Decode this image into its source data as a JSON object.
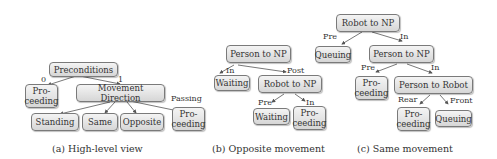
{
  "panels": [
    {
      "caption": "(a) High-level view",
      "nodes": {
        "preconditions": "Preconditions",
        "proceeding": "Pro-\nceeding",
        "movement_direction": "Movement Direction",
        "standing": "Standing",
        "same": "Same",
        "opposite": "Opposite",
        "proceeding2": "Pro-\nceeding"
      },
      "edge_labels": {
        "zero": "0",
        "one": "1",
        "passing": "Passing"
      }
    },
    {
      "caption": "(b) Opposite movement",
      "nodes": {
        "person_to_np": "Person to NP",
        "waiting": "Waiting",
        "robot_to_np": "Robot to NP",
        "waiting2": "Waiting",
        "proceeding": "Pro-\nceeding"
      },
      "edge_labels": {
        "in": "In",
        "post": "Post",
        "pre": "Pre",
        "in2": "In"
      }
    },
    {
      "caption": "(c) Same movement",
      "nodes": {
        "robot_to_np": "Robot to NP",
        "queuing": "Queuing",
        "person_to_np": "Person to NP",
        "proceeding": "Pro-\nceeding",
        "person_to_robot": "Person to Robot",
        "proceeding2": "Pro-\nceeding",
        "queuing2": "Queuing"
      },
      "edge_labels": {
        "pre": "Pre",
        "in": "In",
        "pre2": "Pre",
        "in2": "In",
        "rear": "Rear",
        "front": "Front"
      }
    }
  ]
}
